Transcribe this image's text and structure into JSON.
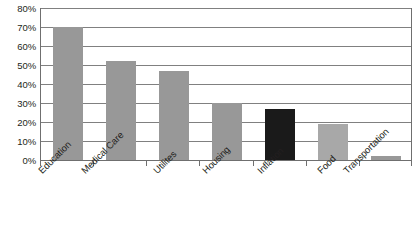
{
  "chart_data": {
    "type": "bar",
    "title": "",
    "xlabel": "",
    "ylabel": "",
    "ylim": [
      0,
      80
    ],
    "grid": true,
    "legend": null,
    "categories": [
      "Education",
      "Medical Care",
      "Utilites",
      "Housing",
      "Inflation",
      "Food",
      "Transportation"
    ],
    "values": [
      70,
      52,
      47,
      30,
      27,
      19,
      2
    ],
    "y_ticks": [
      "0%",
      "10%",
      "20%",
      "30%",
      "40%",
      "50%",
      "60%",
      "70%",
      "80%"
    ],
    "y_tick_values": [
      0,
      10,
      20,
      30,
      40,
      50,
      60,
      70,
      80
    ],
    "bar_colors": [
      "#989898",
      "#989898",
      "#989898",
      "#989898",
      "#1a1a1a",
      "#a8a8a8",
      "#989898"
    ],
    "highlight_category": "Inflation",
    "highlight_color": "#1a1a1a",
    "default_bar_color": "#989898",
    "axis_color": "#6f6f6f",
    "gridline_color": "#808080",
    "text_color": "#231f20",
    "background": "#ffffff"
  }
}
